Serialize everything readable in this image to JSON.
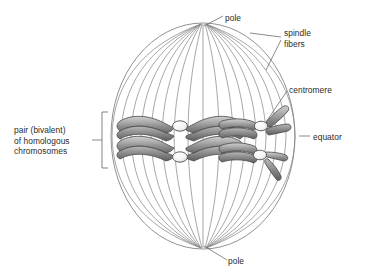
{
  "diagram": {
    "background_color": "#ffffff",
    "outline_color": "#7d7d7d",
    "text_color": "#2b2b2b",
    "chromosome_colors": {
      "light": "#c9c9c9",
      "mid": "#9a9a9a",
      "dark": "#6e6e6e",
      "outline": "#4a4a4a",
      "centromere_fill": "#fdfdfd",
      "centromere_outline": "#555555"
    }
  },
  "labels": {
    "pole_top": "pole",
    "pole_bottom": "pole",
    "spindle_line1": "spindle",
    "spindle_line2": "fibers",
    "centromere": "centromere",
    "equator": "equator",
    "bivalent_line1": "pair (bivalent)",
    "bivalent_line2": "of homologous",
    "bivalent_line3": "chromosomes"
  },
  "structure": {
    "cell_shape": "sphere",
    "spindle_fiber_count": 17,
    "bivalent_count": 2,
    "centromere_count": 4,
    "poles": [
      "top",
      "bottom"
    ]
  }
}
